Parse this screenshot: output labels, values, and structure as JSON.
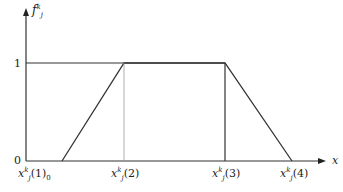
{
  "diagram": {
    "type": "trapezoidal membership function",
    "y_axis": {
      "label_base": "f",
      "label_sub": "j",
      "label_sup": "k",
      "ticks": [
        {
          "value": "1"
        },
        {
          "value": "0"
        }
      ]
    },
    "x_axis": {
      "label": "x"
    },
    "x_ticks": [
      {
        "base": "x",
        "sub": "j",
        "sup": "k",
        "arg": "(1)",
        "suffix": "0"
      },
      {
        "base": "x",
        "sub": "j",
        "sup": "k",
        "arg": "(2)",
        "suffix": ""
      },
      {
        "base": "x",
        "sub": "j",
        "sup": "k",
        "arg": "(3)",
        "suffix": ""
      },
      {
        "base": "x",
        "sub": "j",
        "sup": "k",
        "arg": "(4)",
        "suffix": ""
      }
    ],
    "points": [
      [
        62,
        161
      ],
      [
        124,
        63
      ],
      [
        225,
        63
      ],
      [
        292,
        161
      ]
    ],
    "colors": {
      "line": "#333333",
      "guide": "#999999"
    }
  }
}
